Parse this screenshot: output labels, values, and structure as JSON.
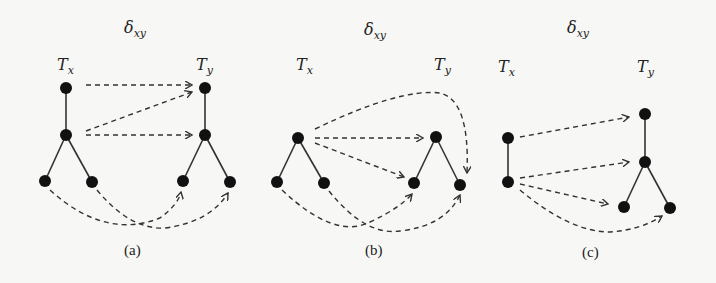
{
  "figure": {
    "panels": [
      {
        "id": "a",
        "caption": "(a)",
        "mapping_label": "δ",
        "mapping_sub": "xy",
        "tree_x_label": "T",
        "tree_x_sub": "x",
        "tree_y_label": "T",
        "tree_y_sub": "y",
        "tree_x_nodes": 4,
        "tree_y_nodes": 4,
        "mappings": [
          {
            "from": "Tx.root",
            "to": "Ty.root"
          },
          {
            "from": "Tx.mid",
            "to": "Ty.root"
          },
          {
            "from": "Tx.mid",
            "to": "Ty.mid"
          },
          {
            "from": "Tx.left_leaf",
            "to": "Ty.right_leaf"
          },
          {
            "from": "Tx.right_leaf",
            "to": "Ty.left_leaf"
          }
        ]
      },
      {
        "id": "b",
        "caption": "(b)",
        "mapping_label": "δ",
        "mapping_sub": "xy",
        "tree_x_label": "T",
        "tree_x_sub": "x",
        "tree_y_label": "T",
        "tree_y_sub": "y",
        "tree_x_nodes": 3,
        "tree_y_nodes": 3,
        "mappings": [
          {
            "from": "Tx.root",
            "to": "Ty.root"
          },
          {
            "from": "Tx.root",
            "to": "Ty.left_leaf"
          },
          {
            "from": "Tx.root",
            "to": "Ty.right_leaf"
          },
          {
            "from": "Tx.left_leaf",
            "to": "Ty.right_leaf"
          },
          {
            "from": "Tx.right_leaf",
            "to": "Ty.left_leaf"
          }
        ]
      },
      {
        "id": "c",
        "caption": "(c)",
        "mapping_label": "δ",
        "mapping_sub": "xy",
        "tree_x_label": "T",
        "tree_x_sub": "x",
        "tree_y_label": "T",
        "tree_y_sub": "y",
        "tree_x_nodes": 2,
        "tree_y_nodes": 4,
        "mappings": [
          {
            "from": "Tx.root",
            "to": "Ty.root"
          },
          {
            "from": "Tx.child",
            "to": "Ty.mid"
          },
          {
            "from": "Tx.child",
            "to": "Ty.left_leaf"
          },
          {
            "from": "Tx.child",
            "to": "Ty.right_leaf"
          }
        ]
      }
    ]
  }
}
